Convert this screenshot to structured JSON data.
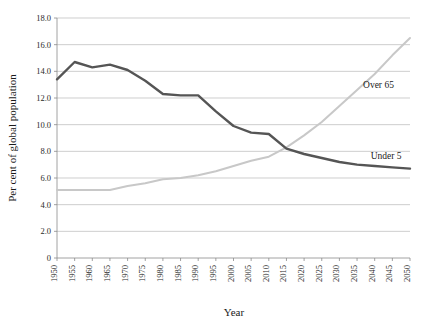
{
  "chart_data": {
    "type": "line",
    "title": "",
    "xlabel": "Year",
    "ylabel": "Per cent of global population",
    "xlim": [
      1950,
      2050
    ],
    "ylim": [
      0,
      18
    ],
    "grid": true,
    "legend_position": "inline-right",
    "x": [
      1950,
      1955,
      1960,
      1965,
      1970,
      1975,
      1980,
      1985,
      1990,
      1995,
      2000,
      2005,
      2010,
      2015,
      2020,
      2025,
      2030,
      2035,
      2040,
      2045,
      2050
    ],
    "xtick_labels": [
      "1950",
      "1955",
      "1960",
      "1965",
      "1970",
      "1975",
      "1980",
      "1985",
      "1990",
      "1995",
      "2000",
      "2005",
      "2010",
      "2015",
      "2020",
      "2025",
      "2030",
      "2035",
      "2040",
      "2045",
      "2050"
    ],
    "ytick_labels": [
      "0",
      "2.0",
      "4.0",
      "6.0",
      "8.0",
      "10.0",
      "12.0",
      "14.0",
      "16.0",
      "18.0"
    ],
    "ytick_values": [
      0,
      2,
      4,
      6,
      8,
      10,
      12,
      14,
      16,
      18
    ],
    "series": [
      {
        "name": "Under 5",
        "label": "Under 5",
        "color": "#555555",
        "values": [
          13.4,
          14.7,
          14.3,
          14.5,
          14.1,
          13.3,
          12.3,
          12.2,
          12.2,
          11.0,
          9.9,
          9.4,
          9.3,
          8.2,
          7.8,
          7.5,
          7.2,
          7.0,
          6.9,
          6.8,
          6.7
        ]
      },
      {
        "name": "Over 65",
        "label": "Over 65",
        "color": "#c8c8c8",
        "values": [
          5.1,
          5.1,
          5.1,
          5.1,
          5.4,
          5.6,
          5.9,
          6.0,
          6.2,
          6.5,
          6.9,
          7.3,
          7.6,
          8.3,
          9.2,
          10.2,
          11.4,
          12.6,
          13.8,
          15.2,
          16.5
        ]
      }
    ]
  },
  "labels": {
    "over65_annotation": "Over 65",
    "under5_annotation": "Under 5"
  }
}
